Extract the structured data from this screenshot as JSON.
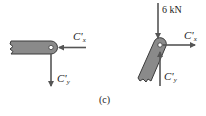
{
  "figure": {
    "caption": "(c)",
    "colors": {
      "member_fill": "#8a8a8a",
      "member_stroke": "#3a3a3a",
      "arrow": "#555555",
      "text": "#222222"
    },
    "left_body": {
      "description": "horizontal member with pin at right end",
      "forces": [
        {
          "name": "C'x",
          "symbol": "C'",
          "subscript": "x",
          "direction": "left"
        },
        {
          "name": "C'y",
          "symbol": "C'",
          "subscript": "y",
          "direction": "down"
        }
      ]
    },
    "right_body": {
      "description": "inclined member with pin at top end",
      "forces": [
        {
          "name": "6 kN",
          "label": "6 kN",
          "direction": "down"
        },
        {
          "name": "C'x",
          "symbol": "C'",
          "subscript": "x",
          "direction": "right"
        },
        {
          "name": "C'y",
          "symbol": "C'",
          "subscript": "y",
          "direction": "up"
        }
      ]
    }
  }
}
